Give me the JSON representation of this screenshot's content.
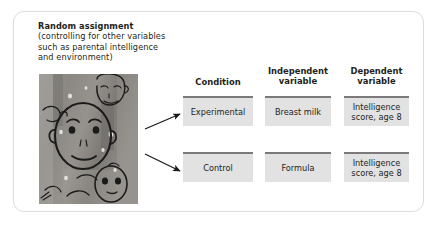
{
  "figure": {
    "heading": {
      "lines": [
        "Random assignment",
        "(controlling for other variables",
        "such as parental intelligence",
        "and environment)"
      ]
    },
    "photo": {
      "alt_label": "grayscale artwork of line-drawn faces"
    },
    "columns": [
      {
        "header_lines": [
          "Condition"
        ]
      },
      {
        "header_lines": [
          "Independent",
          "variable"
        ]
      },
      {
        "header_lines": [
          "Dependent",
          "variable"
        ]
      }
    ],
    "rows": [
      {
        "cells": [
          {
            "lines": [
              "Experimental"
            ]
          },
          {
            "lines": [
              "Breast milk"
            ]
          },
          {
            "lines": [
              "Intelligence",
              "score, age 8"
            ]
          }
        ]
      },
      {
        "cells": [
          {
            "lines": [
              "Control"
            ]
          },
          {
            "lines": [
              "Formula"
            ]
          },
          {
            "lines": [
              "Intelligence",
              "score, age 8"
            ]
          }
        ]
      }
    ],
    "colors": {
      "frame_border": "#dcdcdc",
      "cell_fill": "#e2e2e2",
      "cell_accent": "#7a7a7a",
      "text": "#231f20",
      "arrow": "#1a1a1a"
    }
  }
}
